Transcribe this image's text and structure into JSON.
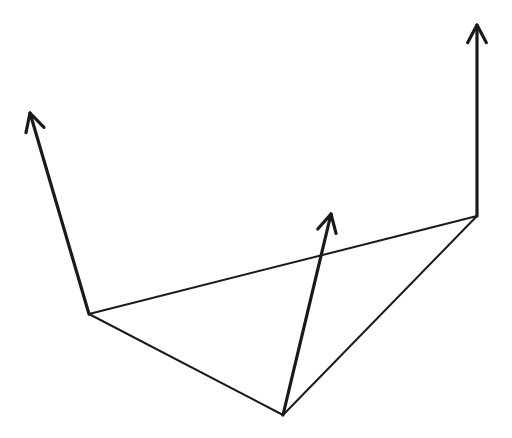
{
  "diagram": {
    "background": "#ffffff",
    "stroke_color": "#1a1a1a",
    "edge_width": 2,
    "arrow_width": 3.2,
    "vertices": [
      {
        "id": "v-left",
        "x": 89,
        "y": 314
      },
      {
        "id": "v-bottom",
        "x": 283,
        "y": 415
      },
      {
        "id": "v-right",
        "x": 477,
        "y": 216
      }
    ],
    "edges": [
      {
        "from": 0,
        "to": 2
      },
      {
        "from": 0,
        "to": 1
      },
      {
        "from": 1,
        "to": 2
      }
    ],
    "arrows": [
      {
        "id": "normal-left",
        "from": 0,
        "tip": {
          "x": 30,
          "y": 113
        }
      },
      {
        "id": "normal-bottom",
        "from": 1,
        "tip": {
          "x": 331,
          "y": 214
        }
      },
      {
        "id": "normal-right",
        "from": 2,
        "tip": {
          "x": 477,
          "y": 25
        }
      }
    ],
    "arrowhead_length": 20,
    "arrowhead_angle_deg": 28
  }
}
